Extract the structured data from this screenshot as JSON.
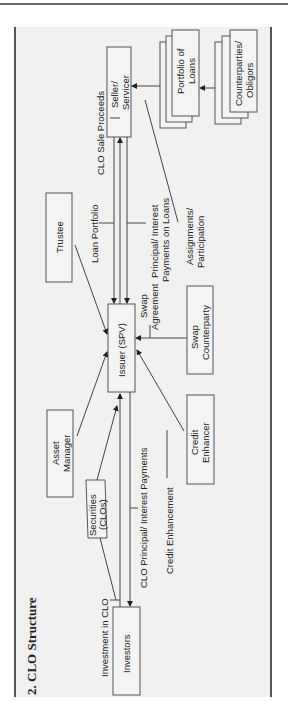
{
  "document": {
    "section_title": "2. CLO Structure",
    "orientation": "rotated 90° counter-clockwise"
  },
  "diagram": {
    "nodes": {
      "seller_servicer": [
        "Seller/",
        "Servicer"
      ],
      "portfolio_of_loans": [
        "Portfolio of",
        "Loans"
      ],
      "counterparties_obligors": [
        "Counterparties/",
        "Obligors"
      ],
      "trustee": [
        "Trustee"
      ],
      "issuer": [
        "Issuer (SPV)"
      ],
      "swap_counterparty": [
        "Swap",
        "Counterparty"
      ],
      "asset_manager": [
        "Asset",
        "Manager"
      ],
      "credit_enhancer": [
        "Credit",
        "Enhancer"
      ],
      "securities": [
        "Securities",
        "(CLOs)"
      ],
      "investors": [
        "Investors"
      ]
    },
    "edge_labels": {
      "clo_sale_proceeds": "CLO Sale Proceeds",
      "loan_portfolio": "Loan Portfolio",
      "principal_interest_loans": [
        "Principal/ Interest",
        "Payments on Loans"
      ],
      "assignments_participation": [
        "Assignments/",
        "Participation"
      ],
      "swap_agreement": [
        "Swap",
        "Agreement"
      ],
      "investment_in_clo": "Investment in CLO",
      "clo_principal_interest": "CLO Principal/ Interest Payments",
      "credit_enhancement": "Credit Enhancement"
    }
  }
}
